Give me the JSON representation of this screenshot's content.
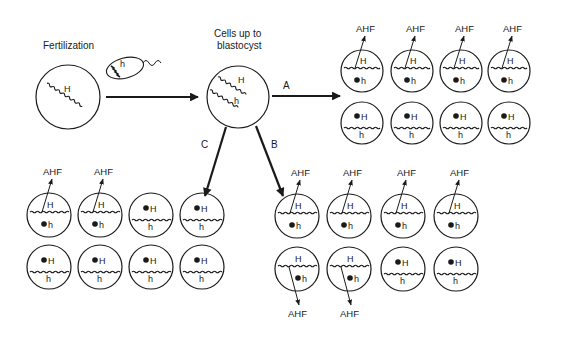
{
  "stages": {
    "fertilization": {
      "label": "Fertilization",
      "egg_allele": "H",
      "sperm_allele": "h"
    },
    "blastocyst": {
      "label_line1": "Cells up to",
      "label_line2": "blastocyst",
      "alleles": [
        "H",
        "h"
      ]
    }
  },
  "branches": {
    "A": {
      "label": "A",
      "cells": [
        {
          "active": "H",
          "inactive": "h",
          "ahf": "AHF"
        },
        {
          "active": "H",
          "inactive": "h",
          "ahf": "AHF"
        },
        {
          "active": "H",
          "inactive": "h",
          "ahf": "AHF"
        },
        {
          "active": "H",
          "inactive": "h",
          "ahf": "AHF"
        },
        {
          "active": "h",
          "inactive": "H",
          "ahf": ""
        },
        {
          "active": "h",
          "inactive": "H",
          "ahf": ""
        },
        {
          "active": "h",
          "inactive": "H",
          "ahf": ""
        },
        {
          "active": "h",
          "inactive": "H",
          "ahf": ""
        }
      ]
    },
    "B": {
      "label": "B",
      "cells": [
        {
          "active": "H",
          "inactive": "h",
          "ahf": "AHF"
        },
        {
          "active": "H",
          "inactive": "h",
          "ahf": "AHF"
        },
        {
          "active": "H",
          "inactive": "h",
          "ahf": "AHF"
        },
        {
          "active": "H",
          "inactive": "h",
          "ahf": "AHF"
        },
        {
          "active": "H",
          "inactive": "h",
          "ahf": "AHF"
        },
        {
          "active": "H",
          "inactive": "h",
          "ahf": "AHF"
        },
        {
          "active": "h",
          "inactive": "H",
          "ahf": ""
        },
        {
          "active": "h",
          "inactive": "H",
          "ahf": ""
        }
      ]
    },
    "C": {
      "label": "C",
      "cells": [
        {
          "active": "H",
          "inactive": "h",
          "ahf": "AHF"
        },
        {
          "active": "H",
          "inactive": "h",
          "ahf": "AHF"
        },
        {
          "active": "h",
          "inactive": "H",
          "ahf": ""
        },
        {
          "active": "h",
          "inactive": "H",
          "ahf": ""
        },
        {
          "active": "h",
          "inactive": "H",
          "ahf": ""
        },
        {
          "active": "h",
          "inactive": "H",
          "ahf": ""
        },
        {
          "active": "h",
          "inactive": "H",
          "ahf": ""
        },
        {
          "active": "h",
          "inactive": "H",
          "ahf": ""
        }
      ]
    }
  },
  "product_label": "AHF",
  "colors": {
    "ink": "#1a1a1a",
    "background": "#ffffff"
  }
}
